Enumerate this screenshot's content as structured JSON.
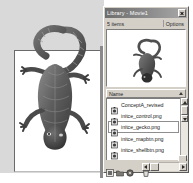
{
  "window": {
    "title": "Library - Movie1",
    "close_icon": "close-icon"
  },
  "info_bar": {
    "items_count": "5 items",
    "options_label": "Options"
  },
  "preview": {
    "icon": "gecko-thumbnail"
  },
  "list": {
    "column_header": "Name",
    "sort_icon": "sort-ascending-icon",
    "rows": [
      {
        "name": "ConceptA_revised",
        "icon": "movie-clip-icon",
        "selected": false
      },
      {
        "name": "initce_control.png",
        "icon": "bitmap-icon",
        "selected": false
      },
      {
        "name": "initce_gecko.png",
        "icon": "bitmap-icon",
        "selected": true
      },
      {
        "name": "initce_mapbtn.png",
        "icon": "bitmap-icon",
        "selected": false
      },
      {
        "name": "initce_shellbtn.png",
        "icon": "bitmap-icon",
        "selected": false
      }
    ]
  },
  "scrollbar": {
    "up_icon": "scroll-up-icon",
    "down_icon": "scroll-down-icon",
    "thumb": "scroll-thumb"
  },
  "toolbar": {
    "new_symbol_icon": "new-symbol-icon",
    "new_folder_icon": "new-folder-icon",
    "properties_icon": "properties-icon",
    "delete_icon": "delete-icon"
  },
  "h_scrollbar": {
    "left_icon": "scroll-left-icon",
    "right_icon": "scroll-right-icon",
    "thumb": "h-scroll-thumb"
  },
  "stage": {
    "artwork": "gecko-illustration"
  },
  "colors": {
    "panel_face": "#d4d0c8",
    "titlebar": "#8c8c8c",
    "stage_backdrop": "#d9d9d9",
    "canvas": "#ffffff",
    "text": "#1c1c1c"
  }
}
